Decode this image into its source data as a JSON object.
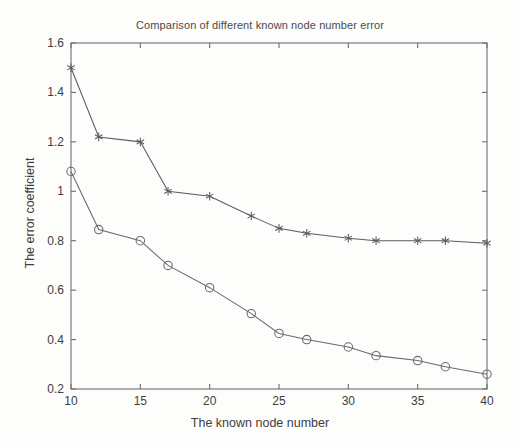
{
  "chart_data": {
    "type": "line",
    "title": "Comparison of different known node number error",
    "xlabel": "The known node number",
    "ylabel": "The error coefficient",
    "xlim": [
      10,
      40
    ],
    "ylim": [
      0.2,
      1.6
    ],
    "xticks": [
      "10",
      "15",
      "20",
      "25",
      "30",
      "35",
      "40"
    ],
    "xtick_values": [
      10,
      15,
      20,
      25,
      30,
      35,
      40
    ],
    "yticks": [
      "0.2",
      "0.4",
      "0.6",
      "0.8",
      "1",
      "1.2",
      "1.4",
      "1.6"
    ],
    "ytick_values": [
      0.2,
      0.4,
      0.6,
      0.8,
      1.0,
      1.2,
      1.4,
      1.6
    ],
    "grid": false,
    "legend": "none",
    "x": [
      10,
      12,
      15,
      17,
      20,
      23,
      25,
      27,
      30,
      32,
      35,
      37,
      40
    ],
    "series": [
      {
        "name": "upper-series",
        "marker": "star",
        "color": "#5b5b5b",
        "values": [
          1.5,
          1.22,
          1.2,
          1.0,
          0.98,
          0.9,
          0.85,
          0.83,
          0.81,
          0.8,
          0.8,
          0.8,
          0.79
        ]
      },
      {
        "name": "lower-series",
        "marker": "circle",
        "color": "#6a6a6a",
        "values": [
          1.08,
          0.845,
          0.8,
          0.7,
          0.61,
          0.505,
          0.425,
          0.4,
          0.37,
          0.335,
          0.315,
          0.29,
          0.26
        ]
      }
    ]
  },
  "figure": {
    "background_color": "#fdfdfc",
    "axis_color": "#6f6f6f",
    "text_color": "#3d3d3d"
  }
}
